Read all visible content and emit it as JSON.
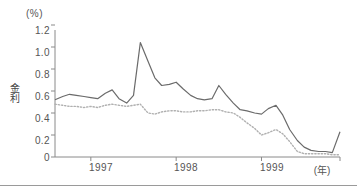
{
  "chart_data": {
    "type": "line",
    "title": "",
    "subtitle": "",
    "unit_label": "(%)",
    "ylabel": "金利",
    "xlabel": "(年)",
    "grid": false,
    "legend_position": "none",
    "ylim": [
      0,
      1.2
    ],
    "yticks": [
      "1.2",
      "1.0",
      "0.8",
      "0.6",
      "0.4",
      "0.2",
      "0"
    ],
    "ytick_values": [
      1.2,
      1.0,
      0.8,
      0.6,
      0.4,
      0.2,
      0
    ],
    "xticks": [
      "1997",
      "1998",
      "1999"
    ],
    "xtick_positions": [
      1997.0,
      1998.0,
      1999.0
    ],
    "xlim": [
      1996.58,
      1999.92
    ],
    "x": [
      1996.58,
      1996.67,
      1996.75,
      1996.83,
      1996.92,
      1997.0,
      1997.08,
      1997.17,
      1997.25,
      1997.33,
      1997.42,
      1997.5,
      1997.58,
      1997.67,
      1997.75,
      1997.83,
      1997.92,
      1998.0,
      1998.08,
      1998.17,
      1998.25,
      1998.33,
      1998.42,
      1998.5,
      1998.58,
      1998.67,
      1998.75,
      1998.83,
      1998.92,
      1999.0,
      1999.08,
      1999.17,
      1999.25,
      1999.33,
      1999.42,
      1999.5,
      1999.58,
      1999.67,
      1999.75,
      1999.83,
      1999.92
    ],
    "series": [
      {
        "name": "無担保コールレート",
        "style": "solid",
        "color": "#6b6b6b",
        "values": [
          0.52,
          0.55,
          0.57,
          0.56,
          0.55,
          0.54,
          0.53,
          0.58,
          0.61,
          0.53,
          0.49,
          0.56,
          1.04,
          0.87,
          0.72,
          0.65,
          0.66,
          0.68,
          0.62,
          0.56,
          0.53,
          0.52,
          0.53,
          0.65,
          0.57,
          0.49,
          0.43,
          0.42,
          0.4,
          0.39,
          0.44,
          0.47,
          0.38,
          0.25,
          0.15,
          0.09,
          0.06,
          0.05,
          0.05,
          0.04,
          0.23
        ]
      },
      {
        "name": "有担保コールレート",
        "style": "dotted",
        "color": "#b0b0b0",
        "values": [
          0.48,
          0.47,
          0.46,
          0.46,
          0.45,
          0.46,
          0.45,
          0.47,
          0.48,
          0.47,
          0.46,
          0.47,
          0.48,
          0.4,
          0.39,
          0.41,
          0.42,
          0.42,
          0.41,
          0.41,
          0.42,
          0.42,
          0.43,
          0.43,
          0.41,
          0.4,
          0.36,
          0.31,
          0.26,
          0.2,
          0.22,
          0.25,
          0.21,
          0.14,
          0.05,
          0.03,
          0.03,
          0.03,
          0.03,
          0.02,
          0.02
        ]
      }
    ]
  },
  "axes": {
    "axis_color": "#8a8a8a",
    "tick_color": "#8a8a8a",
    "text_color": "#555555"
  }
}
